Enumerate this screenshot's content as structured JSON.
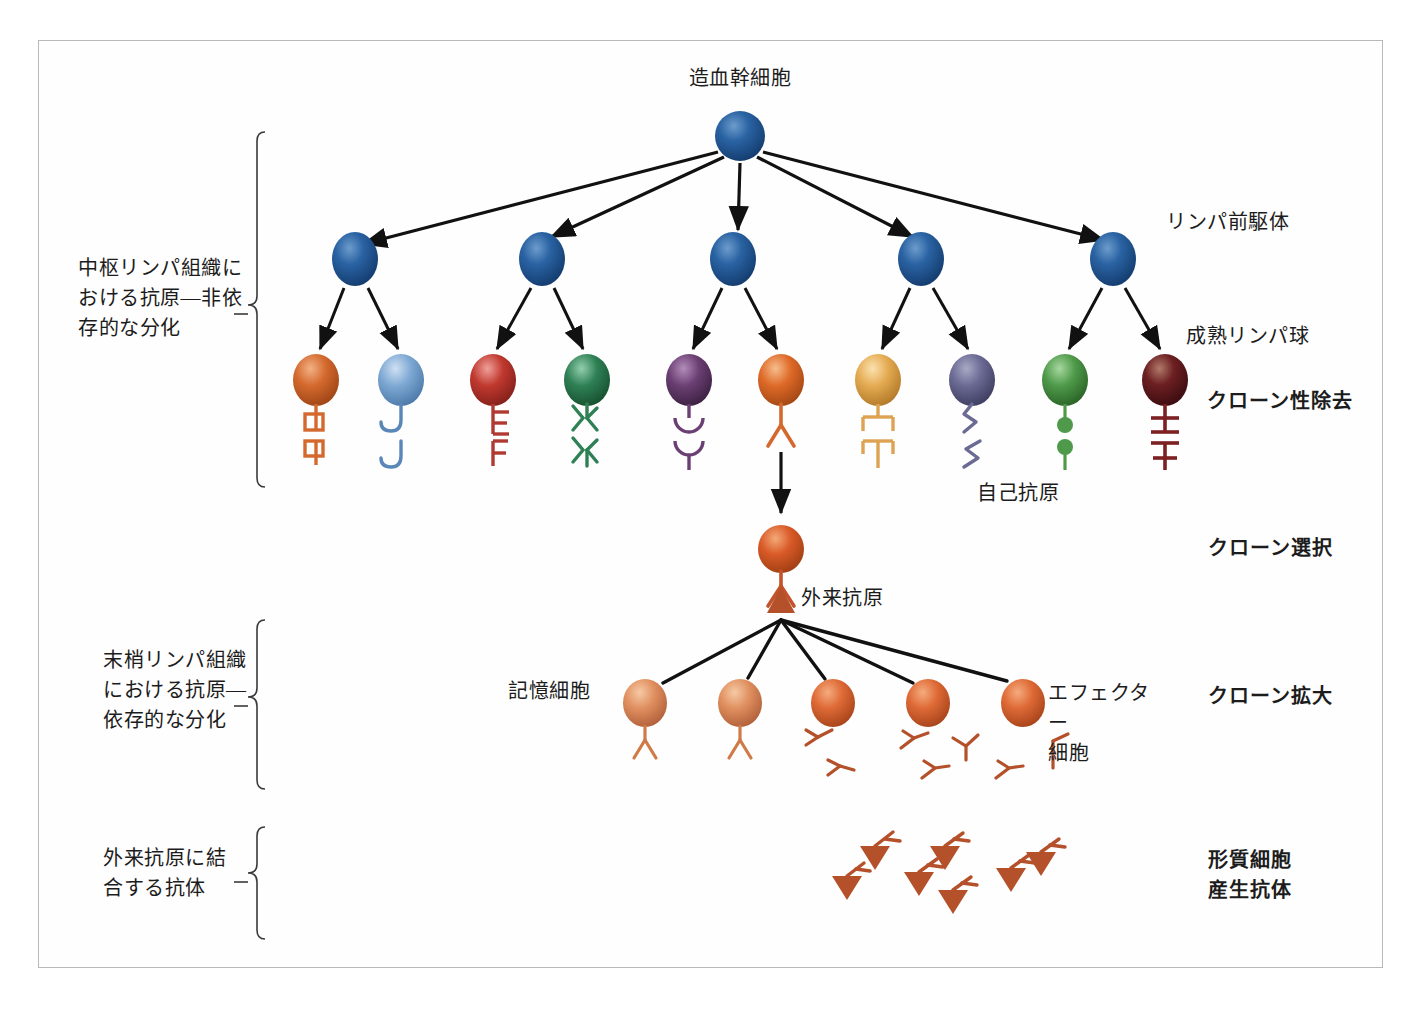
{
  "figure": {
    "title": "造血幹細胞",
    "type": "biology-flow-diagram",
    "background": "#ffffff",
    "frame_color": "#b9b9b9"
  },
  "stage_labels_left": [
    {
      "id": "central",
      "text": "中枢リンパ組織に\nおける抗原―非依\n存的な分化"
    },
    {
      "id": "peripheral",
      "text": "末梢リンパ組織\nにおける抗原―\n依存的な分化"
    },
    {
      "id": "antibody",
      "text": "外来抗原に結\n合する抗体"
    }
  ],
  "stage_labels_right": [
    {
      "id": "clonal-deletion",
      "text": "クローン性除去",
      "bold": true
    },
    {
      "id": "clonal-selection",
      "text": "クローン選択",
      "bold": true
    },
    {
      "id": "clonal-expansion",
      "text": "クローン拡大",
      "bold": true
    },
    {
      "id": "plasma-cell",
      "text": "形質細胞\n産生抗体",
      "bold": true
    }
  ],
  "inline_labels": [
    {
      "id": "lymphoid-precursor",
      "text": "リンパ前駆体"
    },
    {
      "id": "mature-lymphocyte",
      "text": "成熟リンパ球"
    },
    {
      "id": "self-antigen",
      "text": "自己抗原"
    },
    {
      "id": "foreign-antigen",
      "text": "外来抗原"
    },
    {
      "id": "memory-cell",
      "text": "記憶細胞"
    },
    {
      "id": "effector-cell",
      "text": "エフェクター\n細胞"
    }
  ],
  "cells": {
    "stem_cell": {
      "x": 740,
      "y": 136,
      "rx": 25,
      "ry": 25,
      "color": "#1d4f8f"
    },
    "precursors": [
      {
        "x": 355,
        "y": 259,
        "color": "#1f5594"
      },
      {
        "x": 542,
        "y": 259,
        "color": "#1f5594"
      },
      {
        "x": 733,
        "y": 259,
        "color": "#1f5594"
      },
      {
        "x": 921,
        "y": 259,
        "color": "#1f5594"
      },
      {
        "x": 1113,
        "y": 259,
        "color": "#1f5594"
      }
    ],
    "mature_lymphocytes": [
      {
        "x": 316,
        "y": 380,
        "color": "#d4692e",
        "receptor": "square-stem",
        "antigen": "square-stem"
      },
      {
        "x": 401,
        "y": 380,
        "color": "#7fa9d4",
        "receptor": "hook",
        "antigen": "hook"
      },
      {
        "x": 493,
        "y": 380,
        "color": "#c0392f",
        "receptor": "e-shape",
        "antigen": "e-shape"
      },
      {
        "x": 587,
        "y": 380,
        "color": "#2f8055",
        "receptor": "double-y",
        "antigen": "double-y"
      },
      {
        "x": 689,
        "y": 380,
        "color": "#6b3f73",
        "receptor": "cup",
        "antigen": "cup"
      },
      {
        "x": 781,
        "y": 380,
        "color": "#de6a28",
        "receptor": "y-shape",
        "antigen": null
      },
      {
        "x": 878,
        "y": 380,
        "color": "#e5ab53",
        "receptor": "t-bar",
        "antigen": "t-bar"
      },
      {
        "x": 972,
        "y": 380,
        "color": "#6a6a94",
        "receptor": "zigzag",
        "antigen": "zigzag"
      },
      {
        "x": 1065,
        "y": 380,
        "color": "#4f9a4a",
        "receptor": "ball-pin",
        "antigen": "ball-pin"
      },
      {
        "x": 1165,
        "y": 380,
        "color": "#6d1f22",
        "receptor": "double-t",
        "antigen": "double-t",
        "deleted": true
      }
    ],
    "selected_clone": {
      "x": 781,
      "y": 549,
      "color": "#d95a28",
      "receptor": "y-shape",
      "bound_antigen": "triangle"
    },
    "expanded_clones": [
      {
        "x": 645,
        "y": 703,
        "color": "#e09060",
        "kind": "memory"
      },
      {
        "x": 740,
        "y": 703,
        "color": "#e09060",
        "kind": "memory"
      },
      {
        "x": 833,
        "y": 703,
        "color": "#de6a36",
        "kind": "effector"
      },
      {
        "x": 928,
        "y": 703,
        "color": "#de6a36",
        "kind": "effector"
      },
      {
        "x": 1023,
        "y": 703,
        "color": "#dd5f2c",
        "kind": "effector"
      }
    ]
  },
  "antibodies": {
    "color": "#b4502a",
    "count": 7,
    "positions": [
      {
        "x": 848,
        "y": 884
      },
      {
        "x": 872,
        "y": 858
      },
      {
        "x": 916,
        "y": 880
      },
      {
        "x": 946,
        "y": 856
      },
      {
        "x": 952,
        "y": 898
      },
      {
        "x": 1008,
        "y": 876
      },
      {
        "x": 1040,
        "y": 860
      }
    ]
  },
  "colors": {
    "arrow": "#111111",
    "bracket": "#3a3a3a",
    "text": "#1c1c1c"
  }
}
